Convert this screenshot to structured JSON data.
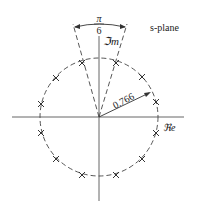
{
  "diagram": {
    "title": "s-plane",
    "axes": {
      "real_label": "ℜe",
      "imag_label": "ℑm"
    },
    "angle_label": {
      "numerator": "π",
      "denominator": "6"
    },
    "radius_label": "0.766",
    "circle": {
      "radius": 0.766,
      "style": "dashed"
    },
    "poles": {
      "count": 12,
      "marker": "×",
      "angles_deg": [
        15,
        45,
        75,
        105,
        135,
        165,
        -15,
        -45,
        -75,
        -105,
        -135,
        -165
      ]
    },
    "colors": {
      "line": "#333333",
      "axis": "#555555",
      "background": "#ffffff"
    }
  }
}
